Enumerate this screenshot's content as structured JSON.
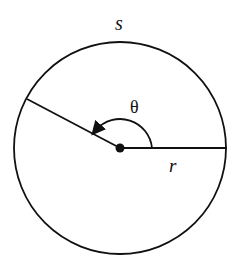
{
  "diagram": {
    "type": "circle-arc-angle",
    "labels": {
      "arc_length": "s",
      "angle": "θ",
      "radius": "r"
    },
    "colors": {
      "stroke": "#111111",
      "background": "#ffffff"
    }
  }
}
